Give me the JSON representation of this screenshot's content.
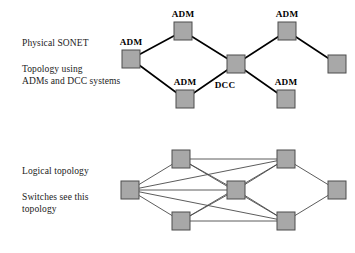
{
  "figure": {
    "type": "network-diagram",
    "background_color": "#ffffff",
    "node_fill": "#a8a8a8",
    "node_stroke": "#4d4d4d",
    "edge_color": "#000000",
    "logical_edge_color": "#4a4a4a"
  },
  "physical": {
    "caption_line1": "Physical SONET",
    "caption_line2": "Topology using",
    "caption_line3": "ADMs and DCC systems",
    "nodes": [
      {
        "id": "p-left",
        "label": "ADM",
        "x": 131,
        "y": 59,
        "label_x": 131,
        "label_y": 45
      },
      {
        "id": "p-top-left",
        "label": "ADM",
        "x": 183,
        "y": 31,
        "label_x": 183,
        "label_y": 17
      },
      {
        "id": "p-bottom-left",
        "label": "ADM",
        "x": 185,
        "y": 99,
        "label_x": 185,
        "label_y": 85
      },
      {
        "id": "p-center",
        "label": "DCC",
        "x": 236,
        "y": 64,
        "label_x": 225,
        "label_y": 88
      },
      {
        "id": "p-top-right",
        "label": "ADM",
        "x": 287,
        "y": 31,
        "label_x": 287,
        "label_y": 17
      },
      {
        "id": "p-bottom-right",
        "label": "ADM",
        "x": 286,
        "y": 99,
        "label_x": 286,
        "label_y": 85
      },
      {
        "id": "p-far-right",
        "label": "",
        "x": 337,
        "y": 64,
        "label_x": 337,
        "label_y": 50
      }
    ],
    "edges": [
      [
        "p-left",
        "p-top-left"
      ],
      [
        "p-left",
        "p-bottom-left"
      ],
      [
        "p-top-left",
        "p-center"
      ],
      [
        "p-bottom-left",
        "p-center"
      ],
      [
        "p-center",
        "p-top-right"
      ],
      [
        "p-center",
        "p-bottom-right"
      ],
      [
        "p-top-right",
        "p-far-right"
      ]
    ]
  },
  "logical": {
    "caption_line1": "Logical topology",
    "caption_line2": "Switches see this",
    "caption_line3": "topology",
    "nodes": [
      {
        "id": "l-left",
        "x": 130,
        "y": 190
      },
      {
        "id": "l-top-left",
        "x": 181,
        "y": 159
      },
      {
        "id": "l-bottom-left",
        "x": 181,
        "y": 221
      },
      {
        "id": "l-center",
        "x": 236,
        "y": 190
      },
      {
        "id": "l-top-right",
        "x": 286,
        "y": 159
      },
      {
        "id": "l-bottom-right",
        "x": 286,
        "y": 221
      },
      {
        "id": "l-far-right",
        "x": 337,
        "y": 190
      }
    ],
    "edges": [
      [
        "l-left",
        "l-top-left"
      ],
      [
        "l-left",
        "l-bottom-left"
      ],
      [
        "l-left",
        "l-center"
      ],
      [
        "l-left",
        "l-top-right"
      ],
      [
        "l-left",
        "l-bottom-right"
      ],
      [
        "l-top-left",
        "l-top-right"
      ],
      [
        "l-top-left",
        "l-center"
      ],
      [
        "l-top-left",
        "l-bottom-right"
      ],
      [
        "l-bottom-left",
        "l-bottom-right"
      ],
      [
        "l-bottom-left",
        "l-center"
      ],
      [
        "l-bottom-left",
        "l-top-right"
      ],
      [
        "l-center",
        "l-top-right"
      ],
      [
        "l-center",
        "l-bottom-right"
      ],
      [
        "l-top-right",
        "l-far-right"
      ],
      [
        "l-bottom-right",
        "l-far-right"
      ]
    ]
  }
}
